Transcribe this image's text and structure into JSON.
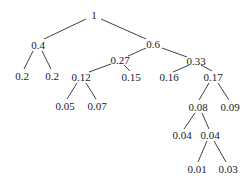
{
  "diagram": {
    "type": "tree",
    "nodes": [
      {
        "id": "n1",
        "label": "1",
        "x": 94,
        "y": 15
      },
      {
        "id": "n2",
        "label": "0.4",
        "x": 38,
        "y": 45
      },
      {
        "id": "n3",
        "label": "0.6",
        "x": 153,
        "y": 44
      },
      {
        "id": "n4",
        "label": "0.2",
        "x": 22,
        "y": 76
      },
      {
        "id": "n5",
        "label": "0.2",
        "x": 52,
        "y": 76
      },
      {
        "id": "n6",
        "label": "0.27",
        "x": 120,
        "y": 60
      },
      {
        "id": "n7",
        "label": "0.33",
        "x": 196,
        "y": 61
      },
      {
        "id": "n8",
        "label": "0.12",
        "x": 81,
        "y": 77
      },
      {
        "id": "n9",
        "label": "0.15",
        "x": 131,
        "y": 77
      },
      {
        "id": "n10",
        "label": "0.16",
        "x": 169,
        "y": 77
      },
      {
        "id": "n11",
        "label": "0.17",
        "x": 213,
        "y": 77
      },
      {
        "id": "n12",
        "label": "0.05",
        "x": 65,
        "y": 106
      },
      {
        "id": "n13",
        "label": "0.07",
        "x": 97,
        "y": 106
      },
      {
        "id": "n14",
        "label": "0.08",
        "x": 198,
        "y": 107
      },
      {
        "id": "n15",
        "label": "0.09",
        "x": 230,
        "y": 107
      },
      {
        "id": "n16",
        "label": "0.04",
        "x": 182,
        "y": 135
      },
      {
        "id": "n17",
        "label": "0.04",
        "x": 210,
        "y": 135
      },
      {
        "id": "n18",
        "label": "0.01",
        "x": 197,
        "y": 169
      },
      {
        "id": "n19",
        "label": "0.03",
        "x": 228,
        "y": 169
      }
    ],
    "edges": [
      {
        "from": "n1",
        "to": "n2",
        "x1": 86,
        "y1": 19,
        "x2": 44,
        "y2": 39
      },
      {
        "from": "n1",
        "to": "n3",
        "x1": 101,
        "y1": 19,
        "x2": 146,
        "y2": 39
      },
      {
        "from": "n2",
        "to": "n4",
        "x1": 33,
        "y1": 51,
        "x2": 24,
        "y2": 69
      },
      {
        "from": "n2",
        "to": "n5",
        "x1": 42,
        "y1": 51,
        "x2": 51,
        "y2": 69
      },
      {
        "from": "n3",
        "to": "n6",
        "x1": 146,
        "y1": 48,
        "x2": 128,
        "y2": 56
      },
      {
        "from": "n3",
        "to": "n7",
        "x1": 162,
        "y1": 48,
        "x2": 187,
        "y2": 57
      },
      {
        "from": "n6",
        "to": "n8",
        "x1": 111,
        "y1": 64,
        "x2": 89,
        "y2": 72
      },
      {
        "from": "n6",
        "to": "n9",
        "x1": 124,
        "y1": 65,
        "x2": 130,
        "y2": 71
      },
      {
        "from": "n7",
        "to": "n10",
        "x1": 189,
        "y1": 65,
        "x2": 173,
        "y2": 72
      },
      {
        "from": "n7",
        "to": "n11",
        "x1": 201,
        "y1": 65,
        "x2": 212,
        "y2": 71
      },
      {
        "from": "n8",
        "to": "n12",
        "x1": 77,
        "y1": 83,
        "x2": 67,
        "y2": 99
      },
      {
        "from": "n8",
        "to": "n13",
        "x1": 86,
        "y1": 83,
        "x2": 96,
        "y2": 99
      },
      {
        "from": "n11",
        "to": "n14",
        "x1": 209,
        "y1": 83,
        "x2": 199,
        "y2": 100
      },
      {
        "from": "n11",
        "to": "n15",
        "x1": 218,
        "y1": 83,
        "x2": 229,
        "y2": 100
      },
      {
        "from": "n14",
        "to": "n16",
        "x1": 195,
        "y1": 113,
        "x2": 184,
        "y2": 129
      },
      {
        "from": "n14",
        "to": "n17",
        "x1": 202,
        "y1": 113,
        "x2": 209,
        "y2": 129
      },
      {
        "from": "n17",
        "to": "n18",
        "x1": 207,
        "y1": 141,
        "x2": 198,
        "y2": 162
      },
      {
        "from": "n17",
        "to": "n19",
        "x1": 214,
        "y1": 141,
        "x2": 226,
        "y2": 162
      }
    ]
  }
}
